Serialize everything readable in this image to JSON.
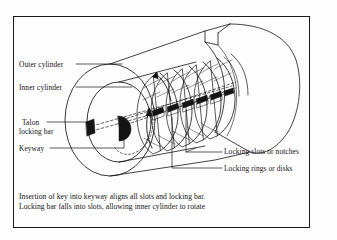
{
  "figure": {
    "type": "technical-line-diagram",
    "border_color": "#1a1a1a",
    "background_color": "#fdfdfd",
    "ink_color": "#141414"
  },
  "labels": {
    "outer_cylinder": "Outer cylinder",
    "inner_cylinder": "Inner cylinder",
    "talon_line1": "Talon",
    "talon_line2": "locking bar",
    "keyway": "Keyway",
    "locking_slots": "Locking slots or notches",
    "locking_rings": "Locking rings or disks"
  },
  "caption": {
    "line1": "Insertion of key into keyway aligns all slots and locking bar.",
    "line2": "Locking bar falls into slots, allowing inner cylinder to rotate"
  },
  "drawing": {
    "locking_ring_count": 6,
    "rotation_arrow": "curved-arrow-counterclockwise",
    "keyway_marks": 2
  }
}
